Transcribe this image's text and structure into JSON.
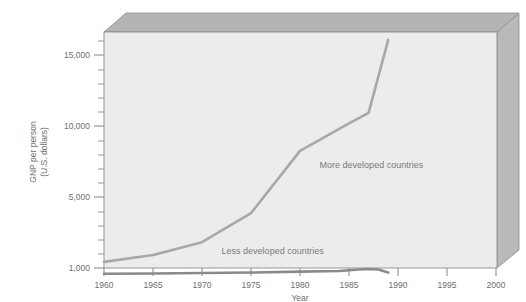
{
  "chart_data": {
    "type": "line",
    "title": "",
    "xlabel": "Year",
    "ylabel": "GNP per person (U.S. dollars)",
    "ylabel_line1": "GNP per person",
    "ylabel_line2": "(U.S. dollars)",
    "xlim": [
      1960,
      2002
    ],
    "ylim": [
      0,
      16500
    ],
    "grid": false,
    "legend_position": "inline-annotations",
    "xticks": [
      1960,
      1965,
      1970,
      1975,
      1980,
      1985,
      1990,
      1995,
      2000
    ],
    "xtick_labels": [
      "1960",
      "1965",
      "1970",
      "1975",
      "1980",
      "1985",
      "1990",
      "1995",
      "2000"
    ],
    "yticks": [
      1000,
      5000,
      10000,
      15000
    ],
    "ytick_labels": [
      "1,000",
      "5,000",
      "10,000",
      "15,000"
    ],
    "yticks_minor": [
      2000,
      3000,
      4000,
      6000,
      7000,
      8000,
      9000,
      11000,
      12000,
      13000,
      14000,
      16000
    ],
    "series": [
      {
        "name": "More developed countries",
        "color": "#a8a8a8",
        "label_x": 1982,
        "label_y": 7600,
        "x": [
          1960,
          1965,
          1970,
          1975,
          1980,
          1985,
          1987,
          1989
        ],
        "values": [
          1400,
          1850,
          2700,
          4600,
          8700,
          10500,
          11200,
          16000
        ]
      },
      {
        "name": "Less developed countries",
        "color": "#8a8a8a",
        "label_x": 1972,
        "label_y": 1950,
        "x": [
          1960,
          1965,
          1970,
          1975,
          1980,
          1984,
          1986,
          1987,
          1988,
          1989
        ],
        "values": [
          620,
          640,
          670,
          700,
          760,
          800,
          900,
          930,
          900,
          700
        ]
      }
    ]
  },
  "styling": {
    "plot_background": "#ececec",
    "box_top_face": "#b4b4b4",
    "box_right_face": "#b9b9b9",
    "axis_color": "#8e8e8e",
    "text_color": "#6e6e6e",
    "page_background": "#ffffff"
  }
}
